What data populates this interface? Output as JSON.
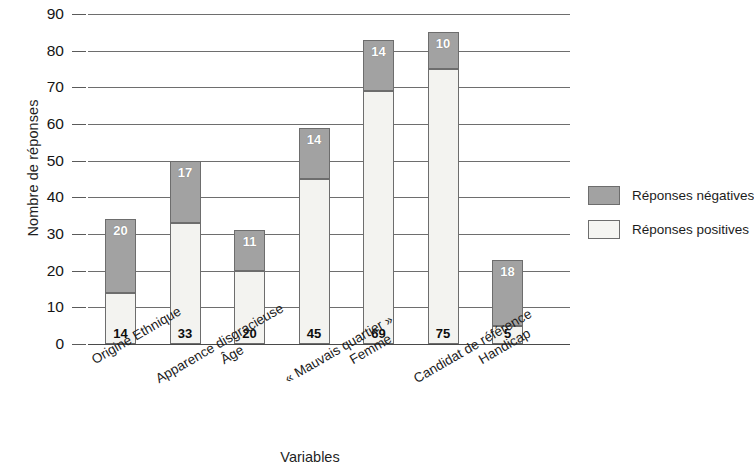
{
  "chart_data": {
    "type": "bar",
    "stacked": true,
    "title": "",
    "xlabel": "Variables",
    "ylabel": "Nombre de réponses",
    "ylim": [
      0,
      90
    ],
    "ytick_step": 10,
    "yticks": [
      "0",
      "10",
      "20",
      "30",
      "40",
      "50",
      "60",
      "70",
      "80",
      "90"
    ],
    "grid": true,
    "legend_position": "right",
    "categories": [
      "Origine Ethnique",
      "Apparence disgracieuse",
      "Âge",
      "« Mauvais quartier »",
      "Femme",
      "Candidat de référence",
      "Handicap"
    ],
    "series": [
      {
        "name": "Réponses positives",
        "color": "#f3f3f0",
        "values": [
          14,
          33,
          20,
          45,
          69,
          75,
          5
        ]
      },
      {
        "name": "Réponses négatives",
        "color": "#a2a2a2",
        "values": [
          20,
          17,
          11,
          14,
          14,
          10,
          18
        ]
      }
    ],
    "totals": [
      34,
      50,
      31,
      59,
      83,
      85,
      23
    ]
  },
  "legend": {
    "items": [
      {
        "label": "Réponses négatives",
        "swatch": "neg"
      },
      {
        "label": "Réponses positives",
        "swatch": "pos"
      }
    ]
  },
  "colors": {
    "negative": "#a2a2a2",
    "positive": "#f3f3f0",
    "gridline": "#6e6e6e",
    "axis": "#4a4a4a",
    "text": "#1a1a1a",
    "background": "#ffffff"
  }
}
